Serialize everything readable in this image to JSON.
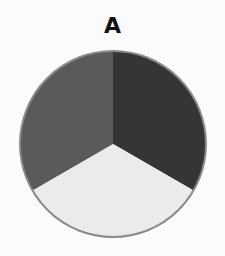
{
  "chart_data": {
    "type": "pie",
    "title": "A",
    "categories": [
      "Slice 1 (right, dark)",
      "Slice 2 (bottom, light)",
      "Slice 3 (left, medium)"
    ],
    "values": [
      33.3,
      33.3,
      33.3
    ],
    "colors": [
      "#353535",
      "#ebebeb",
      "#5a5a5a"
    ],
    "start_angle_deg": -90,
    "direction": "clockwise",
    "outline_color": "#8a8a8a",
    "legend": false,
    "labels_shown": false
  },
  "layout": {
    "center_x": 113,
    "center_y": 144,
    "radius": 93
  }
}
